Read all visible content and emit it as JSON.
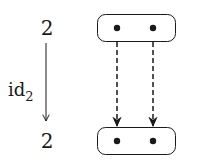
{
  "diagram": {
    "source_object": {
      "label": "2"
    },
    "target_object": {
      "label": "2"
    },
    "morphism": {
      "name": "id",
      "subscript": "2"
    },
    "top_set": {
      "elements": 2
    },
    "bottom_set": {
      "elements": 2
    },
    "mapping": [
      {
        "from": 0,
        "to": 0,
        "style": "dashed"
      },
      {
        "from": 1,
        "to": 1,
        "style": "dashed"
      }
    ],
    "colors": {
      "stroke": "#1a1a1a",
      "background": "#ffffff"
    }
  }
}
